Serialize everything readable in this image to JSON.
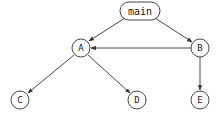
{
  "diagram": {
    "type": "directed-graph",
    "colors": {
      "stroke": "#333333",
      "text": "#222222",
      "background": "#ffffff"
    },
    "nodes": [
      {
        "id": "main",
        "label": "main",
        "shape": "rounded-rect",
        "x": 140,
        "y": 11
      },
      {
        "id": "A",
        "label": "A",
        "shape": "circle",
        "x": 81,
        "y": 48
      },
      {
        "id": "B",
        "label": "B",
        "shape": "circle",
        "x": 200,
        "y": 48
      },
      {
        "id": "C",
        "label": "C",
        "shape": "circle",
        "x": 20,
        "y": 100
      },
      {
        "id": "D",
        "label": "D",
        "shape": "circle",
        "x": 137,
        "y": 100
      },
      {
        "id": "E",
        "label": "E",
        "shape": "circle",
        "x": 200,
        "y": 100
      }
    ],
    "edges": [
      {
        "from": "main",
        "to": "A"
      },
      {
        "from": "main",
        "to": "B"
      },
      {
        "from": "B",
        "to": "A"
      },
      {
        "from": "A",
        "to": "C"
      },
      {
        "from": "A",
        "to": "D"
      },
      {
        "from": "B",
        "to": "E"
      }
    ]
  }
}
